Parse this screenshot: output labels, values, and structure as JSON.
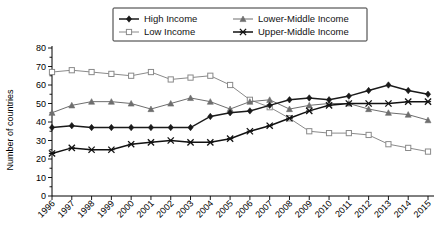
{
  "chart_data": {
    "type": "line",
    "title": "",
    "xlabel": "",
    "ylabel": "Number of countries",
    "ylim": [
      0,
      80
    ],
    "yticks": [
      0,
      10,
      20,
      30,
      40,
      50,
      60,
      70,
      80
    ],
    "grid": false,
    "legend_position": "top",
    "categories": [
      "1996",
      "1997",
      "1998",
      "1999",
      "2000",
      "2001",
      "2002",
      "2003",
      "2004",
      "2005",
      "2006",
      "2007",
      "2008",
      "2009",
      "2010",
      "2011",
      "2012",
      "2013",
      "2014",
      "2015"
    ],
    "series": [
      {
        "name": "High Income",
        "marker": "filled-diamond",
        "color": "#1a1a1a",
        "values": [
          37,
          38,
          37,
          37,
          37,
          37,
          37,
          37,
          43,
          45,
          46,
          49,
          52,
          53,
          52,
          54,
          57,
          60,
          57,
          55
        ]
      },
      {
        "name": "Low Income",
        "marker": "open-square",
        "color": "#8a8a8a",
        "values": [
          67,
          68,
          67,
          66,
          65,
          67,
          63,
          64,
          65,
          60,
          52,
          48,
          42,
          35,
          34,
          34,
          33,
          28,
          26,
          24
        ]
      },
      {
        "name": "Lower-Middle Income",
        "marker": "filled-triangle",
        "color": "#6e6e6e",
        "values": [
          45,
          49,
          51,
          51,
          50,
          47,
          50,
          53,
          51,
          47,
          51,
          52,
          47,
          49,
          50,
          50,
          47,
          45,
          44,
          41
        ]
      },
      {
        "name": "Upper-Middle Income",
        "marker": "cross-x",
        "color": "#111111",
        "values": [
          23,
          26,
          25,
          25,
          28,
          29,
          30,
          29,
          29,
          31,
          35,
          38,
          42,
          46,
          49,
          50,
          50,
          50,
          51,
          51
        ]
      }
    ]
  },
  "legend": {
    "entries": [
      {
        "label": "High Income"
      },
      {
        "label": "Low Income"
      },
      {
        "label": "Lower-Middle Income"
      },
      {
        "label": "Upper-Middle Income"
      }
    ]
  }
}
